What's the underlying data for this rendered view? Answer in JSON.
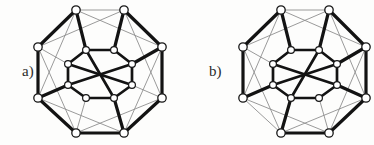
{
  "figure": {
    "name": "tesseract-edge-highlight-pair",
    "background_color": "#fdfdfc",
    "thin_edge_color": "#8e8e8e",
    "bold_edge_color": "#131313",
    "node_fill": "#ffffff",
    "node_stroke": "#161616",
    "width": 374,
    "height": 145
  },
  "panels": [
    {
      "id": "a",
      "label": "a)",
      "label_x": 22,
      "label_y": 64,
      "origin_x": 0,
      "nodes": {
        "outer": [
          {
            "id": "O0",
            "x": 76,
            "y": 10,
            "r": 4.2
          },
          {
            "id": "O1",
            "x": 124,
            "y": 10,
            "r": 4.2
          },
          {
            "id": "O2",
            "x": 162,
            "y": 47,
            "r": 4.2
          },
          {
            "id": "O3",
            "x": 162,
            "y": 98,
            "r": 4.2
          },
          {
            "id": "O4",
            "x": 124,
            "y": 133,
            "r": 4.2
          },
          {
            "id": "O5",
            "x": 76,
            "y": 133,
            "r": 4.2
          },
          {
            "id": "O6",
            "x": 38,
            "y": 98,
            "r": 4.2
          },
          {
            "id": "O7",
            "x": 38,
            "y": 47,
            "r": 4.2
          }
        ],
        "inner": [
          {
            "id": "I0",
            "x": 86,
            "y": 50,
            "r": 3.4
          },
          {
            "id": "I1",
            "x": 114,
            "y": 50,
            "r": 3.4
          },
          {
            "id": "I2",
            "x": 132,
            "y": 64,
            "r": 3.4
          },
          {
            "id": "I3",
            "x": 132,
            "y": 85,
            "r": 3.4
          },
          {
            "id": "I4",
            "x": 114,
            "y": 98,
            "r": 3.4
          },
          {
            "id": "I5",
            "x": 86,
            "y": 98,
            "r": 3.4
          },
          {
            "id": "I6",
            "x": 68,
            "y": 85,
            "r": 3.4
          },
          {
            "id": "I7",
            "x": 68,
            "y": 64,
            "r": 3.4
          }
        ]
      },
      "edges_thin": [
        [
          "O0",
          "O1"
        ],
        [
          "O1",
          "O2"
        ],
        [
          "O2",
          "O3"
        ],
        [
          "O3",
          "O4"
        ],
        [
          "O4",
          "O5"
        ],
        [
          "O5",
          "O6"
        ],
        [
          "O6",
          "O7"
        ],
        [
          "O7",
          "O0"
        ],
        [
          "O0",
          "O2"
        ],
        [
          "O1",
          "O7"
        ],
        [
          "O2",
          "O4"
        ],
        [
          "O3",
          "O5"
        ],
        [
          "O4",
          "O6"
        ],
        [
          "O5",
          "O7"
        ],
        [
          "O6",
          "O0"
        ],
        [
          "O3",
          "O1"
        ],
        [
          "I0",
          "I1"
        ],
        [
          "I1",
          "I2"
        ],
        [
          "I2",
          "I3"
        ],
        [
          "I3",
          "I4"
        ],
        [
          "I4",
          "I5"
        ],
        [
          "I5",
          "I6"
        ],
        [
          "I6",
          "I7"
        ],
        [
          "I7",
          "I0"
        ],
        [
          "O0",
          "I0"
        ],
        [
          "O1",
          "I1"
        ],
        [
          "O2",
          "I2"
        ],
        [
          "O3",
          "I3"
        ],
        [
          "O4",
          "I4"
        ],
        [
          "O5",
          "I5"
        ],
        [
          "O6",
          "I6"
        ],
        [
          "O7",
          "I7"
        ]
      ],
      "edges_bold": [
        [
          "O7",
          "O0"
        ],
        [
          "O0",
          "I0"
        ],
        [
          "O1",
          "O2"
        ],
        [
          "O1",
          "I1"
        ],
        [
          "O6",
          "I6"
        ],
        [
          "O3",
          "O4"
        ],
        [
          "O4",
          "I4"
        ],
        [
          "O5",
          "O4"
        ],
        [
          "O6",
          "O5"
        ],
        [
          "O2",
          "I2"
        ],
        [
          "O7",
          "O6"
        ],
        [
          "O2",
          "O3"
        ]
      ],
      "edges_bold_inner": [
        [
          "I7",
          "I0"
        ],
        [
          "I0",
          "I1"
        ],
        [
          "I1",
          "I2"
        ],
        [
          "I6",
          "I7"
        ],
        [
          "I5",
          "I6"
        ],
        [
          "I4",
          "I5"
        ],
        [
          "I3",
          "I4"
        ],
        [
          "I2",
          "I3"
        ],
        [
          "I7",
          "I3"
        ],
        [
          "I0",
          "I4"
        ],
        [
          "I6",
          "I2"
        ]
      ]
    },
    {
      "id": "b",
      "label": "b)",
      "label_x": 22,
      "label_y": 64,
      "origin_x": 187,
      "nodes": {
        "outer": [
          {
            "id": "O0",
            "x": 94,
            "y": 10,
            "r": 4.2
          },
          {
            "id": "O1",
            "x": 142,
            "y": 10,
            "r": 4.2
          },
          {
            "id": "O2",
            "x": 179,
            "y": 47,
            "r": 4.2
          },
          {
            "id": "O3",
            "x": 179,
            "y": 98,
            "r": 4.2
          },
          {
            "id": "O4",
            "x": 142,
            "y": 133,
            "r": 4.2
          },
          {
            "id": "O5",
            "x": 94,
            "y": 133,
            "r": 4.2
          },
          {
            "id": "O6",
            "x": 56,
            "y": 98,
            "r": 4.2
          },
          {
            "id": "O7",
            "x": 56,
            "y": 47,
            "r": 4.2
          }
        ],
        "inner": [
          {
            "id": "I0",
            "x": 104,
            "y": 50,
            "r": 3.4
          },
          {
            "id": "I1",
            "x": 132,
            "y": 50,
            "r": 3.4
          },
          {
            "id": "I2",
            "x": 150,
            "y": 64,
            "r": 3.4
          },
          {
            "id": "I3",
            "x": 150,
            "y": 85,
            "r": 3.4
          },
          {
            "id": "I4",
            "x": 132,
            "y": 98,
            "r": 3.4
          },
          {
            "id": "I5",
            "x": 104,
            "y": 98,
            "r": 3.4
          },
          {
            "id": "I6",
            "x": 86,
            "y": 85,
            "r": 3.4
          },
          {
            "id": "I7",
            "x": 86,
            "y": 64,
            "r": 3.4
          }
        ]
      },
      "edges_thin": [
        [
          "O0",
          "O1"
        ],
        [
          "O1",
          "O2"
        ],
        [
          "O2",
          "O3"
        ],
        [
          "O3",
          "O4"
        ],
        [
          "O4",
          "O5"
        ],
        [
          "O5",
          "O6"
        ],
        [
          "O6",
          "O7"
        ],
        [
          "O7",
          "O0"
        ],
        [
          "O0",
          "O2"
        ],
        [
          "O1",
          "O7"
        ],
        [
          "O2",
          "O4"
        ],
        [
          "O3",
          "O5"
        ],
        [
          "O4",
          "O6"
        ],
        [
          "O5",
          "O7"
        ],
        [
          "O6",
          "O0"
        ],
        [
          "O3",
          "O1"
        ],
        [
          "I0",
          "I1"
        ],
        [
          "I1",
          "I2"
        ],
        [
          "I2",
          "I3"
        ],
        [
          "I3",
          "I4"
        ],
        [
          "I4",
          "I5"
        ],
        [
          "I5",
          "I6"
        ],
        [
          "I6",
          "I7"
        ],
        [
          "I7",
          "I0"
        ],
        [
          "O0",
          "I0"
        ],
        [
          "O1",
          "I1"
        ],
        [
          "O2",
          "I2"
        ],
        [
          "O3",
          "I3"
        ],
        [
          "O4",
          "I4"
        ],
        [
          "O5",
          "I5"
        ],
        [
          "O6",
          "I6"
        ],
        [
          "O7",
          "I7"
        ]
      ],
      "edges_bold": [
        [
          "O7",
          "O0"
        ],
        [
          "O0",
          "I0"
        ],
        [
          "O1",
          "O2"
        ],
        [
          "O1",
          "I1"
        ],
        [
          "O6",
          "O7"
        ],
        [
          "O3",
          "O4"
        ],
        [
          "O4",
          "O5"
        ],
        [
          "O5",
          "I5"
        ],
        [
          "O2",
          "I2"
        ],
        [
          "O6",
          "I6"
        ],
        [
          "O3",
          "I3"
        ],
        [
          "O2",
          "O3"
        ]
      ],
      "edges_bold_inner": [
        [
          "I0",
          "I1"
        ],
        [
          "I1",
          "I2"
        ],
        [
          "I7",
          "I0"
        ],
        [
          "I6",
          "I7"
        ],
        [
          "I5",
          "I6"
        ],
        [
          "I4",
          "I5"
        ],
        [
          "I3",
          "I4"
        ],
        [
          "I2",
          "I3"
        ],
        [
          "I7",
          "I3"
        ],
        [
          "I1",
          "I5"
        ],
        [
          "I6",
          "I2"
        ]
      ]
    }
  ]
}
